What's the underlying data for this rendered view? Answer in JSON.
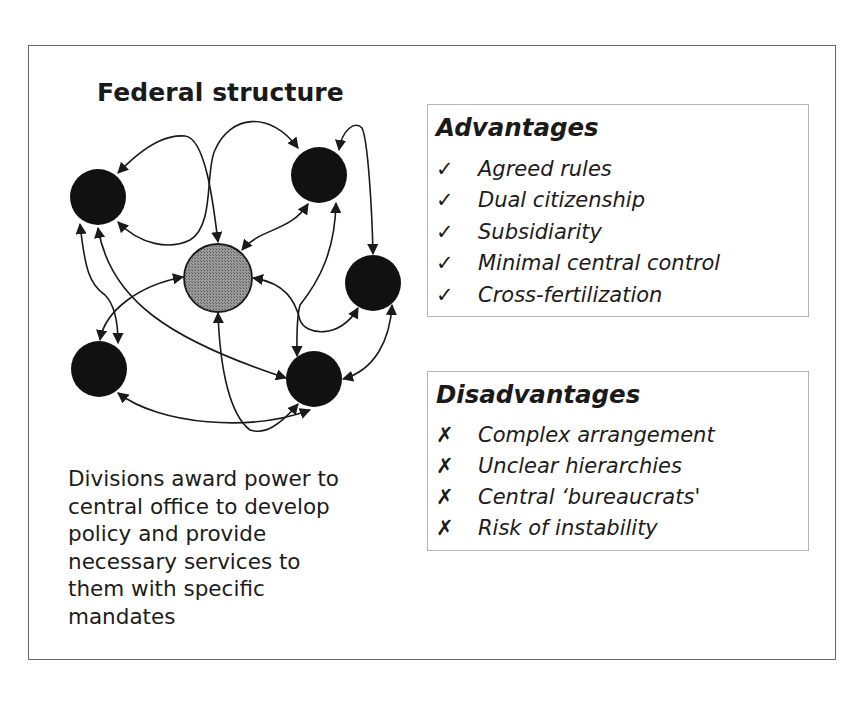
{
  "diagram": {
    "title": "Federal structure",
    "center_node": {
      "id": "central-office",
      "cx": 218,
      "cy": 278,
      "r": 34,
      "fill": "#8c8c8c"
    },
    "division_nodes": [
      {
        "id": "division-top-left",
        "cx": 98,
        "cy": 197,
        "r": 28
      },
      {
        "id": "division-top-right",
        "cx": 319,
        "cy": 175,
        "r": 28
      },
      {
        "id": "division-right",
        "cx": 373,
        "cy": 283,
        "r": 28
      },
      {
        "id": "division-bottom-left",
        "cx": 99,
        "cy": 369,
        "r": 28
      },
      {
        "id": "division-bottom-right",
        "cx": 314,
        "cy": 379,
        "r": 28
      }
    ],
    "node_color": "#111111",
    "description_lines": [
      "Divisions award power to",
      "central office to develop",
      "policy and provide",
      "necessary services to",
      "them with specific",
      "mandates"
    ]
  },
  "advantages": {
    "title": "Advantages",
    "icon": "checkmark-icon",
    "mark": "✓",
    "items": [
      "Agreed rules",
      "Dual citizenship",
      "Subsidiarity",
      "Minimal central control",
      "Cross-fertilization"
    ]
  },
  "disadvantages": {
    "title": "Disadvantages",
    "icon": "cross-icon",
    "mark": "✗",
    "items": [
      "Complex arrangement",
      "Unclear hierarchies",
      "Central ‘bureaucrats'",
      "Risk of instability"
    ]
  }
}
